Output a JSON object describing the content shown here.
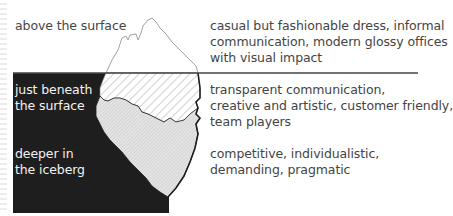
{
  "diagram": {
    "type": "iceberg-model",
    "colors": {
      "background": "#ffffff",
      "underwater": "#1e1e1e",
      "iceberg_outline": "#888888",
      "waterline": "#444444",
      "text_dark_bg": "#f2f2f2",
      "text_light_bg": "#444444",
      "ice_lower_fill": "#dcdcdc"
    },
    "levels": [
      {
        "label_lines": [
          "above the surface"
        ],
        "description_lines": [
          "casual but fashionable dress, informal",
          "communication, modern glossy offices",
          "with visual impact"
        ]
      },
      {
        "label_lines": [
          "just beneath",
          "the surface"
        ],
        "description_lines": [
          "transparent communication,",
          "creative and artistic, customer friendly,",
          "team players"
        ]
      },
      {
        "label_lines": [
          "deeper in",
          "the iceberg"
        ],
        "description_lines": [
          "competitive, individualistic,",
          "demanding, pragmatic"
        ]
      }
    ]
  }
}
